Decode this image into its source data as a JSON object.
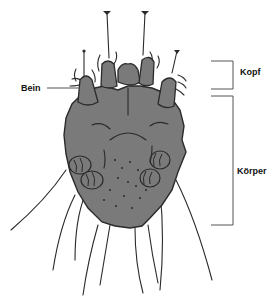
{
  "diagram": {
    "labels": {
      "leg": "Bein",
      "head": "Kopf",
      "body": "Körper"
    },
    "colors": {
      "body_fill": "#7a7a7a",
      "outline": "#2a2a2a",
      "leader_line": "#555555",
      "background": "#ffffff"
    }
  }
}
